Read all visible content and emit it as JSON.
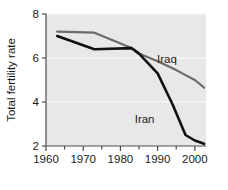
{
  "chart_data": {
    "type": "line",
    "title": "",
    "xlabel": "",
    "ylabel": "Total fertility rate",
    "xlim": [
      1960,
      2003
    ],
    "ylim": [
      2,
      8
    ],
    "grid": true,
    "legend_position": "inline-annotation",
    "x_ticks": [
      1960,
      1970,
      1980,
      1990,
      2000
    ],
    "x_tick_labels": [
      "1960",
      "1970",
      "1980",
      "1990",
      "2000"
    ],
    "x_minor_ticks": [
      1965,
      1975,
      1985,
      1995
    ],
    "y_ticks": [
      2,
      4,
      6,
      8
    ],
    "y_tick_labels": [
      "2",
      "4",
      "6",
      "8"
    ],
    "series": [
      {
        "name": "Iraq",
        "color": "#6b6b6b",
        "label_x": 1992.5,
        "label_y": 5.95,
        "x": [
          1963,
          1973,
          1983,
          1985,
          1990,
          1995,
          2000,
          2002.5
        ],
        "values": [
          7.2,
          7.15,
          6.45,
          6.2,
          5.85,
          5.45,
          5.0,
          4.65
        ]
      },
      {
        "name": "Iran",
        "color": "#111111",
        "label_x": 1986.5,
        "label_y": 3.25,
        "x": [
          1963,
          1973,
          1983,
          1985,
          1990,
          1994,
          1997.5,
          2000,
          2002.5
        ],
        "values": [
          7.0,
          6.4,
          6.45,
          6.2,
          5.3,
          3.9,
          2.5,
          2.25,
          2.1
        ]
      }
    ]
  },
  "axis": {
    "y_title": "Total fertility rate",
    "y_labels": [
      "8",
      "6",
      "4",
      "2"
    ],
    "x_labels": [
      "1960",
      "1970",
      "1980",
      "1990",
      "2000"
    ]
  },
  "annotations": {
    "iraq_label": "Iraq",
    "iran_label": "Iran"
  },
  "colors": {
    "plot_background": "#e8e8e8",
    "page_background": "#ffffff",
    "iraq_line": "#6b6b6b",
    "iran_line": "#111111",
    "axis": "#4a4a4a",
    "gridline": "#f7f7f7",
    "text": "#1a1a1a"
  }
}
